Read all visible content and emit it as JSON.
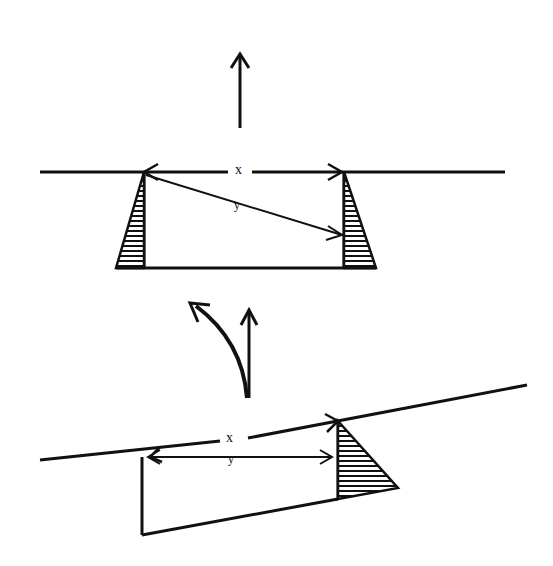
{
  "diagram": {
    "top_figure": {
      "label_x": "x",
      "label_y": "y"
    },
    "bottom_figure": {
      "label_x": "x",
      "label_y": "y"
    },
    "colors": {
      "ink": "#111111",
      "background": "#ffffff"
    }
  }
}
